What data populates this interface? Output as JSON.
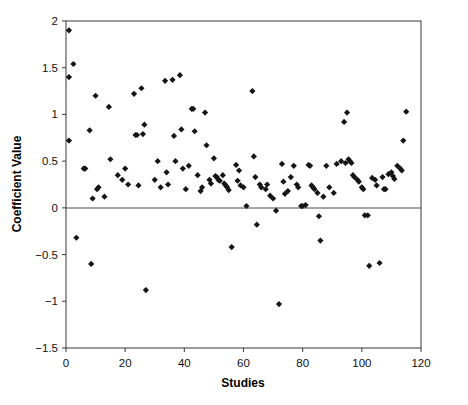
{
  "chart_data": {
    "type": "scatter",
    "title": "",
    "xlabel": "Studies",
    "ylabel": "Coefficient Value",
    "xlim": [
      0,
      120
    ],
    "ylim": [
      -1.5,
      2
    ],
    "xticks": [
      0,
      20,
      40,
      60,
      80,
      100,
      120
    ],
    "yticks": [
      2,
      1.5,
      1,
      0.5,
      0,
      -0.5,
      -1,
      -1.5
    ],
    "xtick_labels": [
      "0",
      "20",
      "40",
      "60",
      "80",
      "100",
      "120"
    ],
    "ytick_labels": [
      "2",
      "1.5",
      "1",
      "0.5",
      "0",
      "-0.5",
      "-1",
      "-1.5"
    ],
    "grid": false,
    "legend": null,
    "marker": "diamond",
    "marker_color": "#151515",
    "reference_line_y": 0,
    "n_points": 134,
    "series": [
      {
        "name": "Coefficient Value",
        "points": [
          [
            1.0,
            1.9
          ],
          [
            1.0,
            1.4
          ],
          [
            1.0,
            0.72
          ],
          [
            2.5,
            1.54
          ],
          [
            3.5,
            -0.32
          ],
          [
            6.0,
            0.42
          ],
          [
            6.5,
            0.42
          ],
          [
            8.0,
            0.83
          ],
          [
            8.5,
            -0.6
          ],
          [
            9.0,
            0.1
          ],
          [
            10.0,
            1.2
          ],
          [
            10.5,
            0.2
          ],
          [
            11.0,
            0.22
          ],
          [
            13.0,
            0.12
          ],
          [
            14.5,
            1.08
          ],
          [
            15.0,
            0.52
          ],
          [
            17.5,
            0.35
          ],
          [
            19.0,
            0.3
          ],
          [
            20.0,
            0.42
          ],
          [
            21.0,
            0.25
          ],
          [
            23.0,
            1.22
          ],
          [
            23.5,
            0.78
          ],
          [
            24.0,
            0.78
          ],
          [
            24.5,
            0.24
          ],
          [
            25.5,
            1.28
          ],
          [
            26.0,
            0.79
          ],
          [
            26.5,
            0.89
          ],
          [
            27.0,
            -0.88
          ],
          [
            30.0,
            0.3
          ],
          [
            31.0,
            0.5
          ],
          [
            32.0,
            0.22
          ],
          [
            33.5,
            1.36
          ],
          [
            34.0,
            0.38
          ],
          [
            34.5,
            0.25
          ],
          [
            36.0,
            1.37
          ],
          [
            36.5,
            0.77
          ],
          [
            37.0,
            0.5
          ],
          [
            38.5,
            1.42
          ],
          [
            39.0,
            0.84
          ],
          [
            39.5,
            0.42
          ],
          [
            40.5,
            0.2
          ],
          [
            41.5,
            0.45
          ],
          [
            42.5,
            1.06
          ],
          [
            43.0,
            1.06
          ],
          [
            43.5,
            0.82
          ],
          [
            44.5,
            0.35
          ],
          [
            45.5,
            0.18
          ],
          [
            46.0,
            0.22
          ],
          [
            47.0,
            1.02
          ],
          [
            47.5,
            0.67
          ],
          [
            48.5,
            0.3
          ],
          [
            49.0,
            0.26
          ],
          [
            50.0,
            0.53
          ],
          [
            50.5,
            0.34
          ],
          [
            51.0,
            0.33
          ],
          [
            51.5,
            0.3
          ],
          [
            52.0,
            0.29
          ],
          [
            53.0,
            0.35
          ],
          [
            53.5,
            0.26
          ],
          [
            54.0,
            0.24
          ],
          [
            54.5,
            0.22
          ],
          [
            55.0,
            0.19
          ],
          [
            56.0,
            -0.42
          ],
          [
            57.5,
            0.46
          ],
          [
            58.5,
            0.4
          ],
          [
            58.0,
            0.29
          ],
          [
            59.0,
            0.24
          ],
          [
            60.0,
            0.22
          ],
          [
            61.0,
            0.02
          ],
          [
            63.0,
            1.25
          ],
          [
            63.5,
            0.55
          ],
          [
            64.0,
            0.33
          ],
          [
            64.5,
            -0.18
          ],
          [
            65.5,
            0.25
          ],
          [
            66.0,
            0.22
          ],
          [
            67.5,
            0.2
          ],
          [
            68.0,
            0.25
          ],
          [
            69.0,
            0.13
          ],
          [
            70.0,
            0.1
          ],
          [
            71.0,
            -0.03
          ],
          [
            72.0,
            -1.03
          ],
          [
            73.0,
            0.47
          ],
          [
            73.5,
            0.28
          ],
          [
            74.0,
            0.15
          ],
          [
            75.0,
            0.18
          ],
          [
            76.0,
            0.33
          ],
          [
            77.0,
            0.45
          ],
          [
            78.0,
            0.25
          ],
          [
            78.5,
            0.22
          ],
          [
            79.5,
            0.02
          ],
          [
            80.0,
            0.02
          ],
          [
            81.0,
            0.03
          ],
          [
            82.0,
            0.46
          ],
          [
            82.5,
            0.45
          ],
          [
            83.0,
            0.24
          ],
          [
            83.5,
            0.22
          ],
          [
            84.0,
            0.2
          ],
          [
            85.0,
            0.16
          ],
          [
            85.5,
            -0.09
          ],
          [
            86.0,
            -0.35
          ],
          [
            87.0,
            0.12
          ],
          [
            88.0,
            0.45
          ],
          [
            89.0,
            0.22
          ],
          [
            90.5,
            0.16
          ],
          [
            91.5,
            0.47
          ],
          [
            93.0,
            0.5
          ],
          [
            94.0,
            0.92
          ],
          [
            94.5,
            0.48
          ],
          [
            95.0,
            1.02
          ],
          [
            95.5,
            0.52
          ],
          [
            96.0,
            0.5
          ],
          [
            96.5,
            0.48
          ],
          [
            97.0,
            0.35
          ],
          [
            97.5,
            0.33
          ],
          [
            98.5,
            0.3
          ],
          [
            99.0,
            0.28
          ],
          [
            100.0,
            0.22
          ],
          [
            100.5,
            0.2
          ],
          [
            101.0,
            -0.08
          ],
          [
            102.0,
            -0.08
          ],
          [
            102.5,
            -0.62
          ],
          [
            103.5,
            0.32
          ],
          [
            104.5,
            0.3
          ],
          [
            105.0,
            0.24
          ],
          [
            106.0,
            -0.59
          ],
          [
            107.0,
            0.33
          ],
          [
            107.5,
            0.2
          ],
          [
            108.0,
            0.2
          ],
          [
            109.0,
            0.36
          ],
          [
            110.0,
            0.38
          ],
          [
            110.5,
            0.34
          ],
          [
            111.0,
            0.31
          ],
          [
            112.0,
            0.45
          ],
          [
            113.0,
            0.42
          ],
          [
            113.5,
            0.4
          ],
          [
            114.0,
            0.72
          ],
          [
            115.0,
            1.03
          ]
        ]
      }
    ]
  },
  "axes": {
    "x_axis_title": "Studies",
    "y_axis_title": "Coefficient Value"
  }
}
